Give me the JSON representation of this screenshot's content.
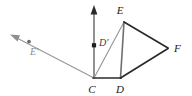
{
  "figure": {
    "background_color": "#ffffff",
    "stroke_color_dark": "#2b2b2b",
    "stroke_color_gray": "#9a9a9a",
    "stroke_color_mid": "#7d7d7d",
    "labels": {
      "c": "C",
      "d": "D",
      "e": "E",
      "f": "F",
      "d_prime": "D'",
      "e_prime": "E'"
    },
    "points": {
      "C": {
        "x": 94,
        "y": 78
      },
      "D": {
        "x": 120,
        "y": 78
      },
      "E": {
        "x": 124,
        "y": 21
      },
      "F": {
        "x": 168,
        "y": 48
      },
      "D_prime_dot": {
        "x": 94,
        "y": 45
      },
      "E_prime_dot": {
        "x": 29,
        "y": 41
      },
      "arrow_up_tip": {
        "x": 94,
        "y": 6
      },
      "arrow_upleft_tip": {
        "x": 11,
        "y": 35
      }
    },
    "label_positions": {
      "C": {
        "x": 90,
        "y": 92
      },
      "D": {
        "x": 116,
        "y": 92
      },
      "E": {
        "x": 121,
        "y": 13
      },
      "F": {
        "x": 174,
        "y": 52
      },
      "D_prime": {
        "x": 99,
        "y": 43
      },
      "E_prime": {
        "x": 31,
        "y": 53
      }
    },
    "segments": [
      {
        "name": "base-c-d",
        "from": "C",
        "to": "D",
        "color": "#2b2b2b"
      },
      {
        "name": "side-d-f",
        "from": "D",
        "to": "F",
        "color": "#2b2b2b"
      },
      {
        "name": "side-e-f",
        "from": "E",
        "to": "F",
        "color": "#2b2b2b"
      },
      {
        "name": "altitude-d-e",
        "from": "D",
        "to": "E",
        "color": "#6e6e6e"
      },
      {
        "name": "diagonal-c-e",
        "from": "C",
        "to": "E",
        "color": "#9a9a9a"
      }
    ],
    "rays": [
      {
        "name": "ray-c-up",
        "from": "C",
        "direction": "up",
        "color": "#6e6e6e",
        "has_arrowhead": true
      },
      {
        "name": "ray-c-upleft",
        "from": "C",
        "direction": "up-left",
        "color": "#9a9a9a",
        "has_arrowhead": true
      }
    ]
  }
}
